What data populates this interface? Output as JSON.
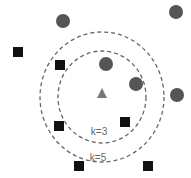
{
  "title_fragment": "",
  "diagram": {
    "type": "knn-classification",
    "query_point": {
      "shape": "triangle",
      "x": 102,
      "y": 94,
      "color": "#777777"
    },
    "class_circle": {
      "color": "#555555",
      "radius": 7,
      "points": [
        {
          "x": 63,
          "y": 21
        },
        {
          "x": 176,
          "y": 12
        },
        {
          "x": 106,
          "y": 64
        },
        {
          "x": 136,
          "y": 84
        },
        {
          "x": 177,
          "y": 95
        }
      ]
    },
    "class_square": {
      "color": "#111111",
      "size": 10,
      "points": [
        {
          "x": 18,
          "y": 52
        },
        {
          "x": 60,
          "y": 65
        },
        {
          "x": 59,
          "y": 126
        },
        {
          "x": 125,
          "y": 122
        },
        {
          "x": 79,
          "y": 166
        },
        {
          "x": 148,
          "y": 166
        }
      ]
    },
    "neighborhoods": [
      {
        "label": "k=3",
        "cx": 102,
        "cy": 97,
        "rx": 44,
        "ry": 46,
        "label_x": 99,
        "label_y": 131
      },
      {
        "label": "k=5",
        "cx": 102,
        "cy": 97,
        "rx": 62,
        "ry": 65,
        "label_x": 98,
        "label_y": 157
      }
    ],
    "line_color": "#666666"
  }
}
